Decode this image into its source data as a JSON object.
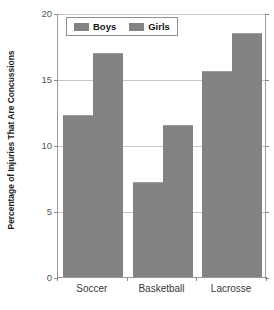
{
  "chart_data": {
    "type": "bar",
    "title": "",
    "subtitle": "",
    "xlabel": "",
    "ylabel": "Percentage of Injuries That Are Concussions",
    "categories": [
      "Soccer",
      "Basketball",
      "Lacrosse"
    ],
    "series": [
      {
        "name": "Boys",
        "values": [
          12.3,
          7.2,
          15.6
        ],
        "color": "#838383"
      },
      {
        "name": "Girls",
        "values": [
          17.0,
          11.5,
          18.5
        ],
        "color": "#838383"
      }
    ],
    "ylim": [
      0,
      20
    ],
    "yticks": [
      0,
      5,
      10,
      15,
      20
    ],
    "ytick_labels": [
      "0",
      "5",
      "10",
      "15",
      "20"
    ],
    "grid": true,
    "grid_axis": "y",
    "legend_position": "top-left-inside",
    "background_color": "#ffffff",
    "axis_color": "#9a9a9a",
    "gridline_color": "#c8c8c8"
  },
  "legend": {
    "entries": [
      {
        "label": "Boys"
      },
      {
        "label": "Girls"
      }
    ]
  },
  "axes": {
    "y_title": "Percentage of Injuries That Are Concussions",
    "y_labels": [
      "20",
      "15",
      "10",
      "5",
      "0"
    ],
    "x_labels": [
      "Soccer",
      "Basketball",
      "Lacrosse"
    ]
  }
}
